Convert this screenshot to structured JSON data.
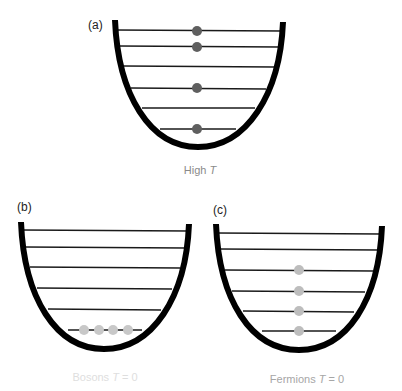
{
  "figure": {
    "panels": [
      {
        "id": "a",
        "label": "(a)",
        "caption_text": "High ",
        "caption_var": "T",
        "caption_color": "#8a8a8a",
        "particle_type": "classical",
        "particle_color": "#5f5f5f",
        "levels": 6,
        "occupied_levels": [
          1,
          2,
          4,
          6
        ],
        "particles_per_level": 1
      },
      {
        "id": "b",
        "label": "(b)",
        "caption_text": "Bosons ",
        "caption_var": "T",
        "caption_suffix": " = 0",
        "caption_color": "#dedede",
        "particle_type": "boson",
        "particle_color": "#c8c8c8",
        "levels": 6,
        "occupied_levels": [
          6
        ],
        "particles_per_level": 4
      },
      {
        "id": "c",
        "label": "(c)",
        "caption_text": "Fermions ",
        "caption_var": "T",
        "caption_suffix": " = 0",
        "caption_color": "#a6a6a6",
        "particle_type": "fermion",
        "particle_color": "#bdbdbd",
        "levels": 6,
        "occupied_levels": [
          3,
          4,
          5,
          6
        ],
        "particles_per_level": 1
      }
    ],
    "well_color": "#000000",
    "level_color": "#1a1a1a"
  }
}
